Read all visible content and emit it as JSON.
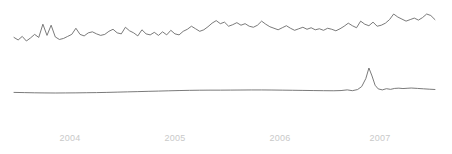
{
  "chart_data": {
    "type": "line",
    "title": "",
    "subtitle": "",
    "xlabel": "",
    "ylabel": "",
    "grid": false,
    "legend": "none",
    "background_color": "#ffffff",
    "line_color": "#6b6b6b",
    "tick_label_color": "#c9c9c9",
    "x_tick_labels": [
      "2004",
      "2005",
      "2006",
      "2007"
    ],
    "x_tick_positions_px": [
      70,
      175,
      280,
      380
    ],
    "xlim": [
      2003.45,
      2007.55
    ],
    "series": [
      {
        "name": "upper-series",
        "description": "noisy volatile series drifting upward",
        "x": [
          2003.45,
          2003.49,
          2003.53,
          2003.57,
          2003.61,
          2003.65,
          2003.69,
          2003.73,
          2003.77,
          2003.81,
          2003.85,
          2003.89,
          2003.93,
          2003.97,
          2004.01,
          2004.05,
          2004.09,
          2004.13,
          2004.17,
          2004.21,
          2004.25,
          2004.29,
          2004.33,
          2004.37,
          2004.41,
          2004.45,
          2004.49,
          2004.53,
          2004.57,
          2004.61,
          2004.65,
          2004.69,
          2004.73,
          2004.77,
          2004.81,
          2004.85,
          2004.89,
          2004.93,
          2004.97,
          2005.01,
          2005.05,
          2005.09,
          2005.13,
          2005.17,
          2005.21,
          2005.25,
          2005.29,
          2005.33,
          2005.37,
          2005.41,
          2005.45,
          2005.49,
          2005.53,
          2005.57,
          2005.61,
          2005.65,
          2005.69,
          2005.73,
          2005.77,
          2005.81,
          2005.85,
          2005.89,
          2005.93,
          2005.97,
          2006.01,
          2006.05,
          2006.09,
          2006.13,
          2006.17,
          2006.21,
          2006.25,
          2006.29,
          2006.33,
          2006.37,
          2006.41,
          2006.45,
          2006.49,
          2006.53,
          2006.57,
          2006.61,
          2006.65,
          2006.69,
          2006.73,
          2006.77,
          2006.81,
          2006.85,
          2006.89,
          2006.93,
          2006.97,
          2007.01,
          2007.05,
          2007.09,
          2007.13,
          2007.17,
          2007.21,
          2007.25,
          2007.29,
          2007.33,
          2007.37,
          2007.41,
          2007.45,
          2007.49,
          2007.53
        ],
        "values": [
          0.4,
          0.35,
          0.42,
          0.33,
          0.39,
          0.46,
          0.4,
          0.66,
          0.44,
          0.64,
          0.41,
          0.36,
          0.38,
          0.42,
          0.46,
          0.58,
          0.46,
          0.43,
          0.49,
          0.51,
          0.47,
          0.44,
          0.46,
          0.52,
          0.56,
          0.49,
          0.47,
          0.6,
          0.53,
          0.49,
          0.43,
          0.55,
          0.47,
          0.45,
          0.5,
          0.44,
          0.51,
          0.45,
          0.54,
          0.47,
          0.45,
          0.52,
          0.56,
          0.62,
          0.57,
          0.52,
          0.55,
          0.61,
          0.68,
          0.73,
          0.67,
          0.7,
          0.62,
          0.65,
          0.69,
          0.64,
          0.67,
          0.62,
          0.6,
          0.64,
          0.72,
          0.66,
          0.61,
          0.58,
          0.55,
          0.59,
          0.63,
          0.58,
          0.54,
          0.57,
          0.6,
          0.56,
          0.59,
          0.55,
          0.57,
          0.54,
          0.58,
          0.56,
          0.53,
          0.57,
          0.62,
          0.68,
          0.63,
          0.59,
          0.72,
          0.66,
          0.63,
          0.7,
          0.62,
          0.64,
          0.68,
          0.75,
          0.86,
          0.8,
          0.76,
          0.72,
          0.75,
          0.78,
          0.74,
          0.79,
          0.86,
          0.83,
          0.75
        ]
      },
      {
        "name": "lower-series",
        "description": "smooth near-flat series with a sharp spike near 2007",
        "x": [
          2003.45,
          2003.55,
          2003.65,
          2003.75,
          2003.85,
          2003.95,
          2004.05,
          2004.15,
          2004.25,
          2004.35,
          2004.45,
          2004.55,
          2004.65,
          2004.75,
          2004.85,
          2004.95,
          2005.05,
          2005.15,
          2005.25,
          2005.35,
          2005.45,
          2005.55,
          2005.65,
          2005.75,
          2005.85,
          2005.95,
          2006.05,
          2006.15,
          2006.25,
          2006.35,
          2006.45,
          2006.55,
          2006.62,
          2006.68,
          2006.73,
          2006.78,
          2006.82,
          2006.86,
          2006.89,
          2006.92,
          2006.95,
          2006.98,
          2007.02,
          2007.06,
          2007.1,
          2007.14,
          2007.18,
          2007.22,
          2007.26,
          2007.3,
          2007.36,
          2007.42,
          2007.48,
          2007.53
        ],
        "values": [
          0.052,
          0.049,
          0.046,
          0.044,
          0.043,
          0.044,
          0.045,
          0.047,
          0.049,
          0.052,
          0.056,
          0.06,
          0.064,
          0.068,
          0.072,
          0.076,
          0.08,
          0.083,
          0.085,
          0.086,
          0.086,
          0.087,
          0.088,
          0.089,
          0.089,
          0.088,
          0.086,
          0.084,
          0.082,
          0.08,
          0.078,
          0.077,
          0.08,
          0.09,
          0.078,
          0.095,
          0.14,
          0.26,
          0.42,
          0.3,
          0.16,
          0.105,
          0.09,
          0.108,
          0.098,
          0.112,
          0.116,
          0.11,
          0.114,
          0.118,
          0.112,
          0.106,
          0.1,
          0.096
        ]
      }
    ]
  },
  "axis": {
    "ticks": [
      {
        "label": "2004"
      },
      {
        "label": "2005"
      },
      {
        "label": "2006"
      },
      {
        "label": "2007"
      }
    ]
  }
}
